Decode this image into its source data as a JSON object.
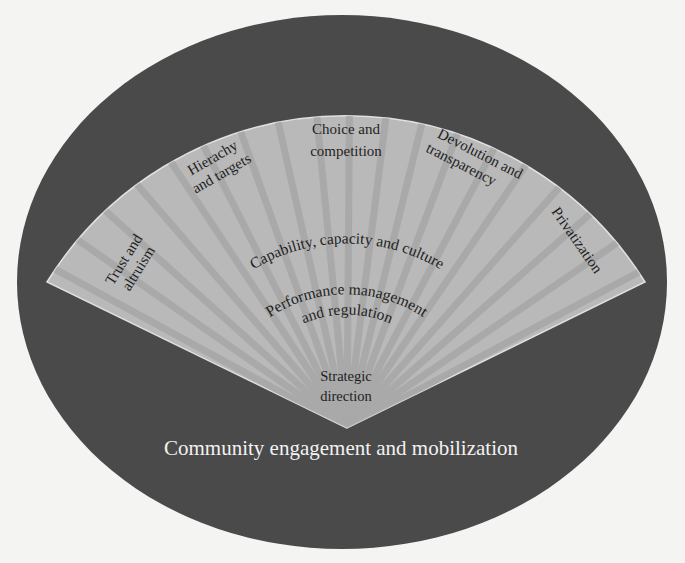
{
  "diagram": {
    "type": "fan-in-ellipse",
    "outer_ring": {
      "label": "Community engagement and mobilization",
      "color": "#4a4a4a"
    },
    "fan": {
      "color": "#b9b9b9",
      "ray_color": "#a3a3a3",
      "segments": [
        {
          "label_lines": [
            "Trust and",
            "altruism"
          ]
        },
        {
          "label_lines": [
            "Hierachy",
            "and targets"
          ]
        },
        {
          "label_lines": [
            "Choice and",
            "competition"
          ]
        },
        {
          "label_lines": [
            "Devolution and",
            "transparency"
          ]
        },
        {
          "label_lines": [
            "Privatization"
          ]
        }
      ],
      "bands": [
        {
          "label": "Capability, capacity and culture"
        },
        {
          "label_lines": [
            "Performance management",
            "and regulation"
          ]
        },
        {
          "label_lines": [
            "Strategic",
            "direction"
          ]
        }
      ]
    }
  },
  "colors": {
    "background": "#f4f4f2",
    "ellipse": "#4a4a4a",
    "fan": "#b9b9b9",
    "fan_edge": "#e0e0e0",
    "text_dark": "#1e1e1e",
    "text_light": "#f2f2f2"
  }
}
